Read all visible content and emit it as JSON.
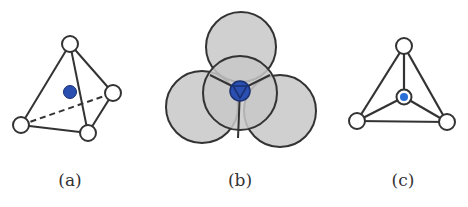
{
  "panels": [
    {
      "id": "a",
      "label": "(a)",
      "description": "tetrahedron with interstitial atom inside"
    },
    {
      "id": "b",
      "label": "(b)",
      "description": "four overlapping spheres around tetrahedral site"
    },
    {
      "id": "c",
      "label": "(c)",
      "description": "tetrahedron viewed from top with central atom"
    }
  ],
  "colors": {
    "line": "#333333",
    "vertex_fill": "#ffffff",
    "sphere_fill": "#c8c8c8",
    "interstitial": "#2a4fb0"
  }
}
